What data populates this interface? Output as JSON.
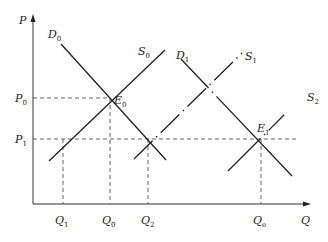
{
  "diagram": {
    "type": "supply-demand",
    "axes": {
      "y_label": "P",
      "x_label": "Q"
    },
    "price_levels": [
      {
        "id": "P0",
        "label": "P",
        "sub": "0"
      },
      {
        "id": "P1",
        "label": "P",
        "sub": "1"
      }
    ],
    "quantity_levels": [
      {
        "id": "Q1",
        "label": "Q",
        "sub": "1"
      },
      {
        "id": "Q0",
        "label": "Q",
        "sub": "0"
      },
      {
        "id": "Q2",
        "label": "Q",
        "sub": "2"
      },
      {
        "id": "Qe",
        "label": "Q",
        "sub": "e"
      }
    ],
    "curves": [
      {
        "id": "D0",
        "label": "D",
        "sub": "0",
        "style": "solid"
      },
      {
        "id": "S0",
        "label": "S",
        "sub": "0",
        "style": "solid"
      },
      {
        "id": "D1",
        "label": "D",
        "sub": "1",
        "style": "dash-dot"
      },
      {
        "id": "S1",
        "label": "S",
        "sub": "1",
        "style": "dash-dot"
      },
      {
        "id": "S2",
        "label": "S",
        "sub": "2",
        "style": "dash-dot"
      }
    ],
    "equilibria": [
      {
        "id": "E0",
        "label": "E",
        "sub": "0",
        "at": [
          "Q0",
          "P0"
        ]
      },
      {
        "id": "E1",
        "label": "E",
        "sub": "1",
        "at": [
          "Qe",
          "P1"
        ]
      }
    ]
  }
}
